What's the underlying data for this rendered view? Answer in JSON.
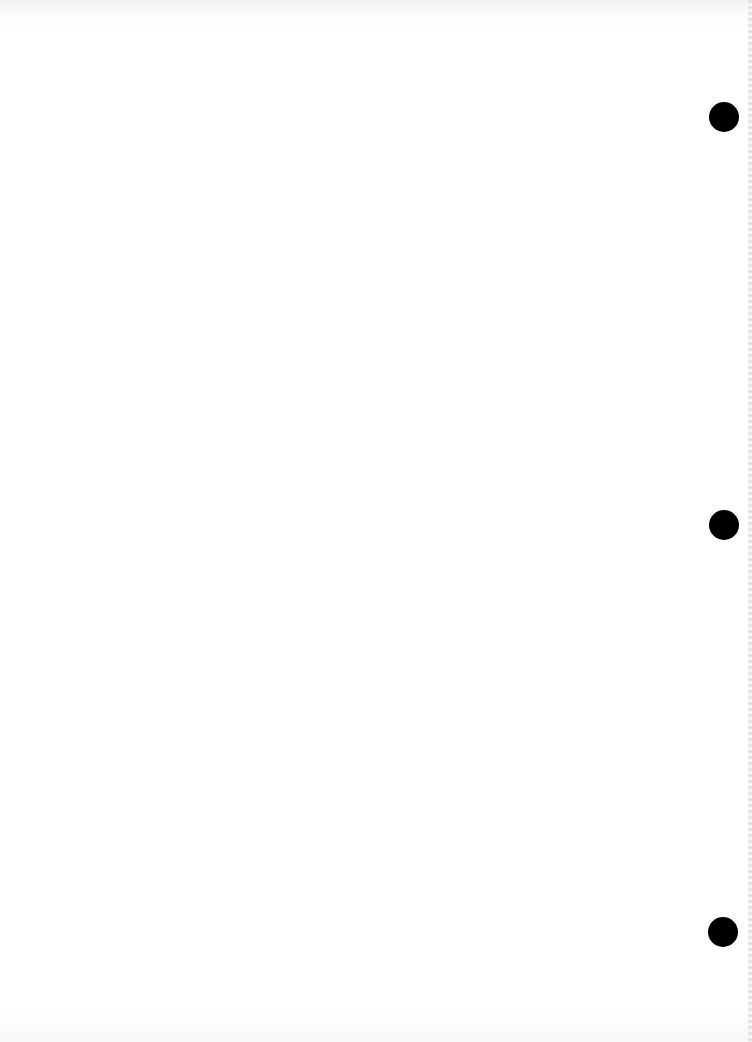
{
  "document": {
    "type": "scanned blank page",
    "bleed_through_lines": [
      "",
      ""
    ],
    "punch_holes": [
      {
        "x": 709,
        "y": 102
      },
      {
        "x": 709,
        "y": 510
      },
      {
        "x": 708,
        "y": 917
      }
    ],
    "colors": {
      "paper": "#ffffff",
      "hole": "#000000"
    }
  }
}
